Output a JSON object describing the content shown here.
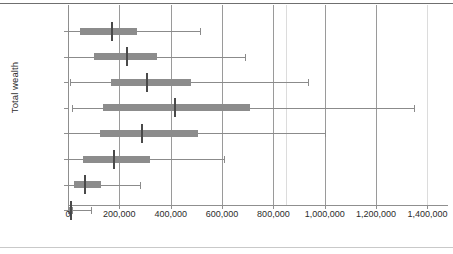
{
  "chart_data": {
    "type": "box",
    "title": "",
    "xlabel": "",
    "ylabel": "Total wealth",
    "grid": true,
    "legend": "none",
    "orientation": "horizontal",
    "xlim": [
      0,
      1480000
    ],
    "xticks": [
      0,
      200000,
      400000,
      600000,
      800000,
      1000000,
      1200000,
      1400000
    ],
    "xtick_labels": [
      "0",
      "200,000",
      "400,000",
      "600,000",
      "800,000",
      "1,000,000",
      "1,200,000",
      "1,400,000"
    ],
    "categories": [
      "85+",
      "75-84",
      "65-74",
      "55-64",
      "45-54",
      "35-44",
      "25-34",
      "16-24"
    ],
    "boxes": [
      {
        "category": "85+",
        "whisker_low": 0,
        "q1": 48000,
        "median": 168000,
        "q3": 268000,
        "whisker_high": 516000
      },
      {
        "category": "75-84",
        "whisker_low": 0,
        "q1": 100000,
        "median": 224000,
        "q3": 348000,
        "whisker_high": 688000
      },
      {
        "category": "65-74",
        "whisker_low": 8000,
        "q1": 168000,
        "median": 304000,
        "q3": 480000,
        "whisker_high": 936000
      },
      {
        "category": "55-64",
        "whisker_low": 16000,
        "q1": 136000,
        "median": 412000,
        "q3": 708000,
        "whisker_high": 1348000
      },
      {
        "category": "45-54",
        "whisker_low": 0,
        "q1": 124000,
        "median": 284000,
        "q3": 508000,
        "whisker_high": 1000000
      },
      {
        "category": "35-44",
        "whisker_low": 0,
        "q1": 60000,
        "median": 176000,
        "q3": 320000,
        "whisker_high": 608000
      },
      {
        "category": "25-34",
        "whisker_low": 0,
        "q1": 24000,
        "median": 64000,
        "q3": 128000,
        "whisker_high": 280000
      },
      {
        "category": "16-24",
        "whisker_low": 0,
        "q1": 0,
        "median": 8000,
        "q3": 20000,
        "whisker_high": 88000
      }
    ],
    "colors": {
      "box_fill": "#8c8c8c",
      "median": "#4a4a4a",
      "whisker": "#8b8b8b",
      "gridline": "#9a9a9a",
      "axis": "#8f8f8f",
      "text": "#2b2b2b",
      "background": "#ffffff"
    }
  }
}
